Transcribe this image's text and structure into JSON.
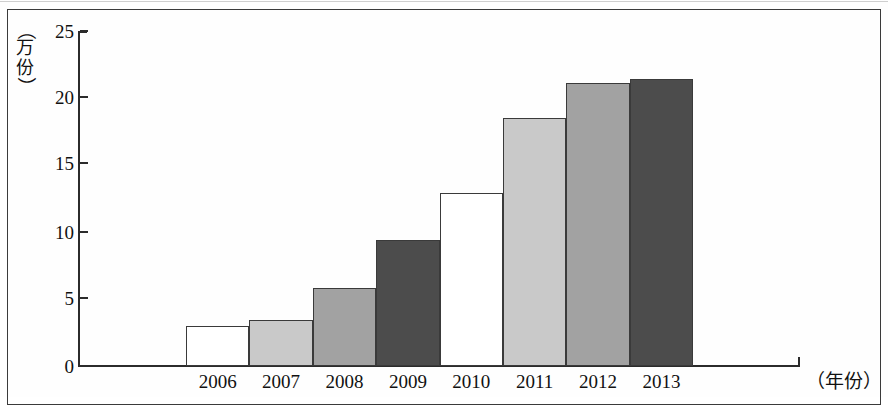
{
  "figure": {
    "y_axis_caption_chars": [
      "（",
      "万",
      "份",
      "）"
    ],
    "x_axis_caption": "（年份）"
  },
  "chart_data": {
    "type": "bar",
    "title": "",
    "subtitle": "",
    "xlabel": "（年份）",
    "ylabel": "（万份）",
    "categories": [
      "2006",
      "2007",
      "2008",
      "2009",
      "2010",
      "2011",
      "2012",
      "2013"
    ],
    "values": [
      3.0,
      3.4,
      5.8,
      9.4,
      12.9,
      18.5,
      21.1,
      21.4
    ],
    "ylim": [
      0,
      25
    ],
    "y_ticks": [
      "0",
      "5",
      "10",
      "15",
      "20",
      "25"
    ],
    "y_tick_values": [
      0,
      5,
      10,
      15,
      20,
      25
    ],
    "xlim_categories": 8,
    "grid": false,
    "legend": "none",
    "bar_colors": [
      "#ffffff",
      "#c9c9c9",
      "#a2a2a2",
      "#4c4c4c",
      "#ffffff",
      "#c9c9c9",
      "#a2a2a2",
      "#4c4c4c"
    ],
    "bar_edge_color": "#3a3a3a",
    "axis_color": "#2b2b2b",
    "background_color": "#fefefe",
    "bars_touch": true
  }
}
